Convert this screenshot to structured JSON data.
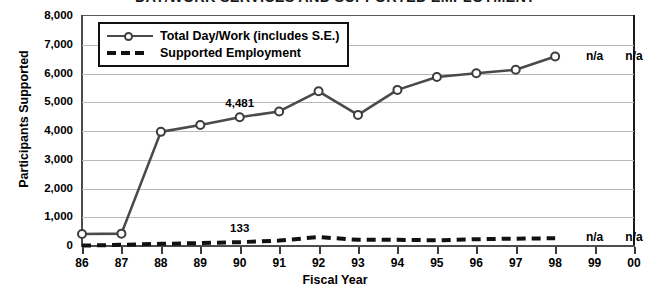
{
  "chart_data": {
    "type": "line",
    "title": "DAY/WORK SERVICES AND SUPPORTED EMPLOYMENT",
    "xlabel": "Fiscal Year",
    "ylabel": "Participants Supported",
    "categories": [
      "86",
      "87",
      "88",
      "89",
      "90",
      "91",
      "92",
      "93",
      "94",
      "95",
      "96",
      "97",
      "98",
      "99",
      "00"
    ],
    "ylim": [
      0,
      8000
    ],
    "ytick_labels": [
      "0",
      "1,000",
      "2,000",
      "3,000",
      "4,000",
      "5,000",
      "6,000",
      "7,000",
      "8,000"
    ],
    "ytick_values": [
      0,
      1000,
      2000,
      3000,
      4000,
      5000,
      6000,
      7000,
      8000
    ],
    "grid": true,
    "legend_position": "top-left",
    "series": [
      {
        "name": "Total Day/Work (includes S.E.)",
        "style": "solid",
        "marker": "open-circle",
        "color": "#4a4a4a",
        "values": [
          420,
          430,
          3970,
          4210,
          4481,
          4680,
          5380,
          4560,
          5430,
          5880,
          6010,
          6130,
          6590,
          null,
          null
        ]
      },
      {
        "name": "Supported Employment",
        "style": "dashed",
        "marker": "none",
        "color": "#111111",
        "values": [
          15,
          40,
          75,
          100,
          133,
          190,
          310,
          215,
          215,
          200,
          235,
          255,
          270,
          null,
          null
        ]
      }
    ],
    "annotations": [
      {
        "text": "4,481",
        "series": 0,
        "category": "90"
      },
      {
        "text": "133",
        "series": 1,
        "category": "90"
      },
      {
        "text": "n/a",
        "series": 0,
        "category": "99"
      },
      {
        "text": "n/a",
        "series": 0,
        "category": "00"
      },
      {
        "text": "n/a",
        "series": 1,
        "category": "99"
      },
      {
        "text": "n/a",
        "series": 1,
        "category": "00"
      }
    ]
  },
  "legend": {
    "items": [
      {
        "label": "Total Day/Work (includes S.E.)"
      },
      {
        "label": "Supported Employment"
      }
    ]
  }
}
